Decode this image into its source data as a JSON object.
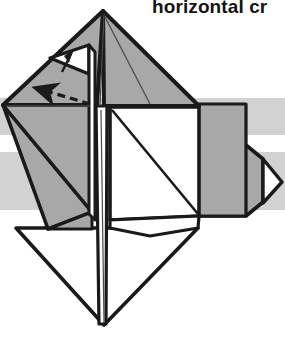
{
  "page": {
    "width": 285,
    "height": 337,
    "background_color": "#ffffff",
    "kind": "scanned-origami-instruction-figure"
  },
  "caption": {
    "text": "horizontal cr",
    "truncated": true,
    "full_text_visible": "horizontal cr",
    "color": "#141414",
    "font_size_px": 19,
    "font_weight": "bold",
    "position": {
      "x": 152,
      "y": -4
    }
  },
  "scan_bands": [
    {
      "name": "upper-grey-band",
      "y": 98,
      "height": 37,
      "color": "#d2d2d2"
    },
    {
      "name": "lower-grey-band",
      "y": 152,
      "height": 58,
      "color": "#d2d2d2"
    }
  ],
  "palette": {
    "paper_shaded": "#a8a8a8",
    "paper_shaded_alt": "#b0b0b0",
    "paper_white": "#ffffff",
    "ink": "#1a1a1a",
    "thin_line": "#4a4a4a",
    "scan_grey": "#d2d2d2"
  },
  "figure": {
    "name": "origami-model-diagram",
    "facets": [
      {
        "name": "top-left-grey-wing",
        "fill": "paper_shaded",
        "points": "103,12 3,105 88,105 103,14"
      },
      {
        "name": "top-right-grey-wing",
        "fill": "paper_shaded",
        "points": "103,12 196,105 108,105 103,14"
      },
      {
        "name": "left-mid-grey-facet",
        "fill": "paper_shaded",
        "points": "3,105 88,105 88,215 50,228"
      },
      {
        "name": "left-lower-grey-facet",
        "fill": "paper_shaded",
        "points": "3,105 50,228 88,215"
      },
      {
        "name": "right-grey-band-facet",
        "fill": "paper_shaded",
        "points": "196,105 244,105 244,215 196,215"
      },
      {
        "name": "right-outer-grey-facet",
        "fill": "paper_shaded",
        "points": "196,105 262,160 262,200 244,215 244,105"
      },
      {
        "name": "center-white-panel",
        "fill": "paper_white",
        "points": "108,107 196,107 196,215 108,215"
      },
      {
        "name": "left-white-small-triangle",
        "fill": "paper_white",
        "points": "52,57 88,45 88,72"
      },
      {
        "name": "bottom-white-triangle",
        "fill": "paper_white",
        "points": "16,228 198,228 104,325"
      },
      {
        "name": "right-tip-white-triangle",
        "fill": "paper_white",
        "points": "262,160 280,183 262,205"
      },
      {
        "name": "center-vertical-white-strip",
        "fill": "paper_white",
        "points": "96,105 105,105 105,325 96,325"
      }
    ],
    "arrow": {
      "name": "fold-direction-arrow",
      "style": "dashed-with-solid-arrowhead",
      "from": {
        "x": 88,
        "y": 103
      },
      "to": {
        "x": 30,
        "y": 86
      },
      "dash_pattern": "7,5",
      "color": "#1a1a1a"
    },
    "crease_lines": [
      {
        "name": "apex-crease-left",
        "from": {
          "x": 103,
          "y": 14
        },
        "to": {
          "x": 100,
          "y": 106
        }
      },
      {
        "name": "apex-crease-right",
        "from": {
          "x": 104,
          "y": 16
        },
        "to": {
          "x": 148,
          "y": 102
        }
      },
      {
        "name": "center-panel-diagonal",
        "from": {
          "x": 110,
          "y": 110
        },
        "to": {
          "x": 196,
          "y": 213
        }
      },
      {
        "name": "bottom-center-fold",
        "from": {
          "x": 100,
          "y": 110
        },
        "to": {
          "x": 103,
          "y": 324
        }
      }
    ]
  }
}
